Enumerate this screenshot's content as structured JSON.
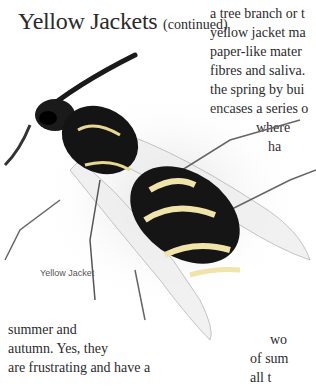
{
  "page": {
    "title": "Yellow Jackets",
    "title_suffix": "(continued)"
  },
  "right_column": {
    "lines": [
      "a tree branch or t",
      "yellow jacket ma",
      "paper-like mater",
      "fibres and saliva.",
      "the spring by bui",
      "encases a series o",
      "where",
      "ha"
    ]
  },
  "illustration": {
    "subject": "yellow-jacket-wasp-drawing",
    "caption": "Yellow Jacket"
  },
  "bottom_left": {
    "lines": [
      "summer and",
      "autumn. Yes, they",
      "are frustrating and have a"
    ]
  },
  "bottom_right": {
    "lines": [
      "wo",
      "of sum",
      "all t"
    ]
  }
}
